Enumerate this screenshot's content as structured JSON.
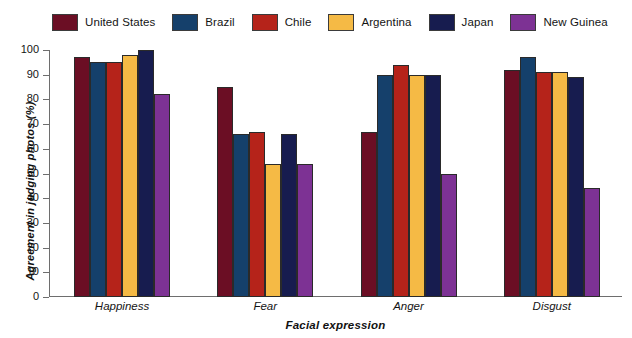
{
  "chart_data": {
    "type": "bar",
    "title": "",
    "xlabel": "Facial expression",
    "ylabel": "Agreement in judging photos (%)",
    "categories": [
      "Happiness",
      "Fear",
      "Anger",
      "Disgust"
    ],
    "ylim": [
      0,
      100
    ],
    "yticks": [
      0,
      10,
      20,
      30,
      40,
      50,
      60,
      70,
      80,
      90,
      100
    ],
    "grid": false,
    "legend_position": "top",
    "series": [
      {
        "name": "United States",
        "color": "#6B0E24",
        "values": [
          97,
          85,
          67,
          92
        ]
      },
      {
        "name": "Brazil",
        "color": "#15406B",
        "values": [
          95,
          66,
          90,
          97
        ]
      },
      {
        "name": "Chile",
        "color": "#B5231A",
        "values": [
          95,
          67,
          94,
          91
        ]
      },
      {
        "name": "Argentina",
        "color": "#F5BA45",
        "values": [
          98,
          54,
          90,
          91
        ]
      },
      {
        "name": "Japan",
        "color": "#171C4F",
        "values": [
          100,
          66,
          90,
          89
        ]
      },
      {
        "name": "New Guinea",
        "color": "#7D3294",
        "values": [
          82,
          54,
          50,
          44
        ]
      }
    ]
  }
}
